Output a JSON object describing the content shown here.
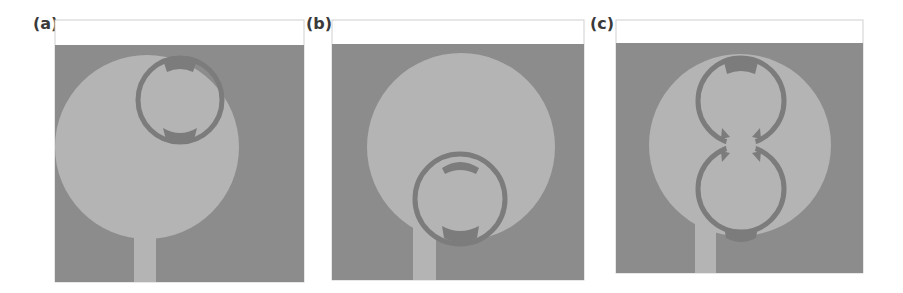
{
  "figure": {
    "panels": [
      {
        "label": "(a)",
        "variant": "single ring at top of circular patch"
      },
      {
        "label": "(b)",
        "variant": "single ring at bottom of circular patch"
      },
      {
        "label": "(c)",
        "variant": "two stacked rings with center disc"
      }
    ],
    "colors": {
      "background": "#ffffff",
      "substrate": "#8c8c8c",
      "patch": "#b4b4b4",
      "slot": "#7c7c7c",
      "frame": "#cfcfcf"
    }
  }
}
